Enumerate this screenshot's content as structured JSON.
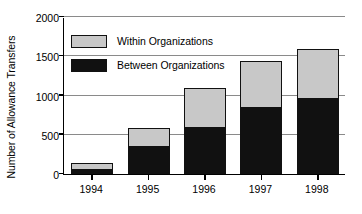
{
  "chart_data": {
    "type": "bar",
    "subtype": "stacked-vertical",
    "title": "",
    "xlabel": "",
    "ylabel": "Number of Allowance Transfers",
    "categories": [
      "1994",
      "1995",
      "1996",
      "1997",
      "1998"
    ],
    "series": [
      {
        "name": "Between Organizations",
        "color": "#111111",
        "values": [
          50,
          350,
          590,
          845,
          950
        ]
      },
      {
        "name": "Within Organizations",
        "color": "#c8c8c8",
        "values": [
          90,
          240,
          500,
          600,
          640
        ]
      }
    ],
    "totals": [
      140,
      590,
      1090,
      1445,
      1590
    ],
    "ylim": [
      0,
      2000
    ],
    "yticks": [
      0,
      500,
      1000,
      1500,
      2000
    ],
    "ytick_labels": [
      "0",
      "500",
      "1000",
      "1500",
      "2000"
    ],
    "grid": true,
    "grid_axis": "y",
    "legend_position": "upper-left-inside",
    "legend_entries": [
      {
        "label": "Within Organizations",
        "color": "#c8c8c8"
      },
      {
        "label": "Between Organizations",
        "color": "#111111"
      }
    ],
    "stack_order": [
      "Between Organizations",
      "Within Organizations"
    ],
    "colors": {
      "within": "#c8c8c8",
      "between": "#111111",
      "axis": "#000000",
      "grid": "#8a8a8a",
      "background": "#ffffff"
    }
  }
}
